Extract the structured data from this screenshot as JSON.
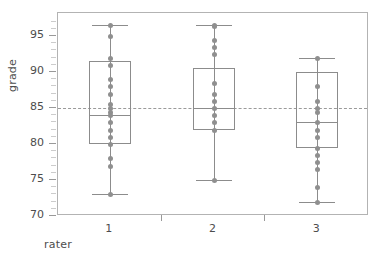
{
  "chart_data": {
    "type": "box",
    "title": "",
    "xlabel": "rater",
    "ylabel": "grade",
    "categories": [
      "1",
      "2",
      "3"
    ],
    "ylim": [
      70,
      98.2
    ],
    "yticks_major": [
      70,
      75,
      80,
      85,
      90,
      95
    ],
    "yticks_minor": [
      71,
      72,
      73,
      74,
      76,
      77,
      78,
      79,
      81,
      82,
      83,
      84,
      86,
      87,
      88,
      89,
      91,
      92,
      93,
      94,
      96,
      97
    ],
    "grid": false,
    "legend": "none",
    "reference_line": {
      "value": 85,
      "style": "dashed",
      "color": "#9a9a9a"
    },
    "boxes": [
      {
        "category": "1",
        "min": 73,
        "q1": 80,
        "median": 84,
        "q3": 91.5,
        "max": 96.5,
        "points": [
          96.5,
          95,
          92,
          91,
          89,
          88,
          87,
          85.5,
          85,
          84.5,
          84,
          83,
          82,
          81,
          80,
          78,
          77,
          73
        ]
      },
      {
        "category": "2",
        "min": 75,
        "q1": 82,
        "median": 85,
        "q3": 90.5,
        "max": 96.5,
        "points": [
          96.5,
          96.4,
          94.5,
          93.5,
          92.5,
          88.5,
          87,
          86,
          85,
          84,
          83,
          82,
          75
        ]
      },
      {
        "category": "3",
        "min": 72,
        "q1": 79.5,
        "median": 83,
        "q3": 90,
        "max": 92,
        "points": [
          92,
          88,
          86,
          85,
          84.5,
          83,
          82,
          81,
          79.5,
          78.5,
          77.5,
          76.5,
          74,
          72
        ]
      }
    ],
    "colors": {
      "box_stroke": "#8c8c8c",
      "point": "#8f8f8f",
      "frame": "#b3b3b3",
      "text": "#4d4d4d",
      "background": "#ffffff"
    }
  }
}
